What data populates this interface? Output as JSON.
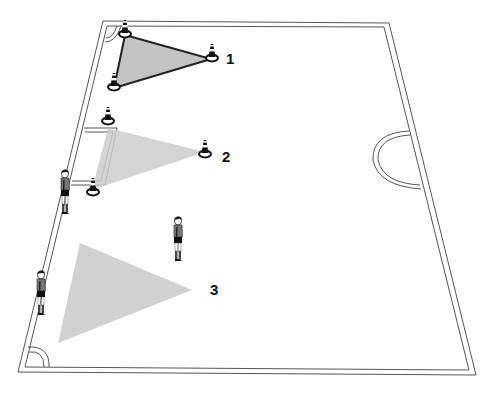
{
  "diagram": {
    "type": "soccer-drill-field",
    "background": "#ffffff",
    "line_color": "#555555",
    "shade_color": "#c8c8c8",
    "labels": [
      {
        "id": "1",
        "text": "1",
        "x": 226,
        "y": 51
      },
      {
        "id": "2",
        "text": "2",
        "x": 222,
        "y": 149
      },
      {
        "id": "3",
        "text": "3",
        "x": 210,
        "y": 282
      }
    ],
    "zones": [
      {
        "id": "zone-1",
        "label": "1",
        "style": "outlined-triangle",
        "points": [
          [
            125,
            35
          ],
          [
            211,
            59
          ],
          [
            114,
            88
          ]
        ]
      },
      {
        "id": "zone-2",
        "label": "2",
        "style": "shaded-triangle",
        "points": [
          [
            108,
            128
          ],
          [
            205,
            152
          ],
          [
            92,
            190
          ]
        ]
      },
      {
        "id": "zone-3",
        "label": "3",
        "style": "shaded-triangle",
        "points": [
          [
            80,
            243
          ],
          [
            192,
            290
          ],
          [
            58,
            343
          ]
        ]
      }
    ],
    "cones": [
      {
        "id": "cone-1a",
        "zone": "1",
        "x": 125,
        "y": 33
      },
      {
        "id": "cone-1b",
        "zone": "1",
        "x": 212,
        "y": 58
      },
      {
        "id": "cone-1c",
        "zone": "1",
        "x": 114,
        "y": 87
      },
      {
        "id": "cone-2a",
        "zone": "2",
        "x": 108,
        "y": 121
      },
      {
        "id": "cone-2b",
        "zone": "2",
        "x": 205,
        "y": 154
      },
      {
        "id": "cone-2c",
        "zone": "2",
        "x": 93,
        "y": 192
      }
    ],
    "players": [
      {
        "id": "player-1",
        "x": 66,
        "y": 172
      },
      {
        "id": "player-2",
        "x": 178,
        "y": 220
      },
      {
        "id": "player-3",
        "x": 41,
        "y": 274
      }
    ]
  }
}
